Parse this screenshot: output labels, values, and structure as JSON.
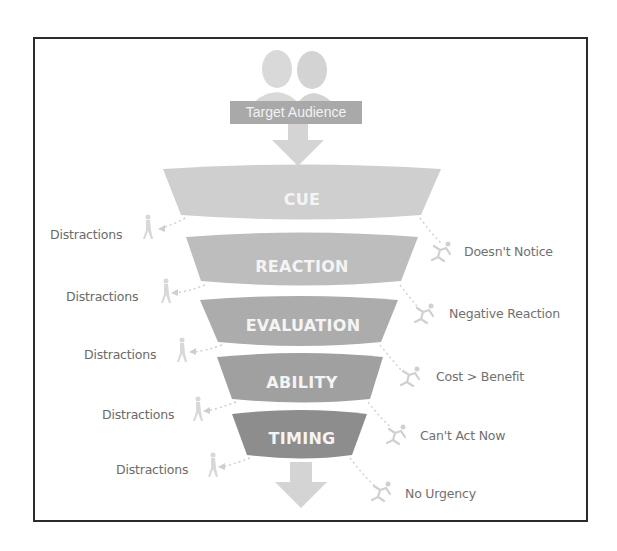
{
  "diagram": {
    "type": "behavior-funnel",
    "entry": {
      "label": "Target Audience",
      "icon": "two-people-icon"
    },
    "stages": [
      {
        "label": "CUE",
        "failure": "Doesn't Notice",
        "leak_left": "Distractions"
      },
      {
        "label": "REACTION",
        "failure": "Negative Reaction",
        "leak_left": "Distractions"
      },
      {
        "label": "EVALUATION",
        "failure": "Cost > Benefit",
        "leak_left": "Distractions"
      },
      {
        "label": "ABILITY",
        "failure": "Can't Act Now",
        "leak_left": "Distractions"
      },
      {
        "label": "TIMING",
        "failure": "No Urgency",
        "leak_left": "Distractions"
      }
    ],
    "colors": {
      "cue": "#cfcfcf",
      "reaction": "#bdbdbd",
      "evaluation": "#acacac",
      "ability": "#a0a0a0",
      "timing": "#8d8d8d",
      "arrow": "#d4d4d4",
      "people": "#d6d6d6",
      "label_box": "#a9a9a9",
      "text_gray": "#6a6a6a",
      "frame": "#2b2b2b"
    }
  }
}
